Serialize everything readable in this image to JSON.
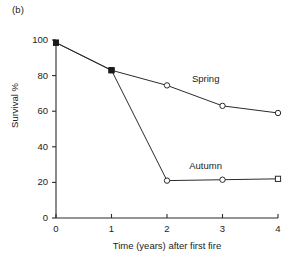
{
  "figure": {
    "panel_label": "(b)",
    "background_color": "#ffffff",
    "ink_color": "#2b2b2b"
  },
  "chart_data": {
    "type": "line",
    "title": "",
    "subtitle": "",
    "panel": "(b)",
    "xlabel": "Time (years) after first fire",
    "ylabel": "Survival %",
    "x": [
      0,
      1,
      2,
      3,
      4
    ],
    "xlim": [
      0,
      4
    ],
    "ylim": [
      0,
      100
    ],
    "xticks": [
      0,
      1,
      2,
      3,
      4
    ],
    "xtick_labels": [
      "0",
      "1",
      "2",
      "3",
      "4"
    ],
    "yticks": [
      0,
      20,
      40,
      60,
      80,
      100
    ],
    "ytick_labels": [
      "0",
      "20",
      "40",
      "60",
      "80",
      "100"
    ],
    "grid": false,
    "legend": "inline-annotations",
    "series": [
      {
        "name": "Spring",
        "label": "Spring",
        "label_x": 2.45,
        "label_y": 78,
        "color": "#2b2b2b",
        "values": [
          98.5,
          83,
          74.5,
          63,
          59
        ],
        "markers": [
          "filled-square",
          "filled-square",
          "open-circle",
          "open-circle",
          "open-circle"
        ]
      },
      {
        "name": "Autumn",
        "label": "Autumn",
        "label_x": 2.4,
        "label_y": 29,
        "color": "#2b2b2b",
        "values": [
          98.5,
          83,
          21,
          21.5,
          22
        ],
        "markers": [
          "filled-square",
          "filled-square",
          "open-circle",
          "open-circle",
          "open-square"
        ]
      }
    ],
    "annotations": [
      {
        "text": "Spring",
        "kind": "series-label"
      },
      {
        "text": "Autumn",
        "kind": "series-label"
      },
      {
        "text": "(b)",
        "kind": "panel-label"
      }
    ]
  }
}
